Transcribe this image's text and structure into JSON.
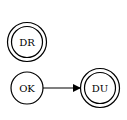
{
  "diagram": {
    "type": "state-machine",
    "nodes": [
      {
        "id": "DR",
        "label": "DR",
        "shape": "doublecircle",
        "cx": 27,
        "cy": 42
      },
      {
        "id": "OK",
        "label": "OK",
        "shape": "circle",
        "cx": 27,
        "cy": 88
      },
      {
        "id": "DU",
        "label": "DU",
        "shape": "doublecircle",
        "cx": 100,
        "cy": 88
      }
    ],
    "edges": [
      {
        "from": "OK",
        "to": "DU",
        "label": ""
      }
    ],
    "colors": {
      "stroke": "#000000",
      "background": "#ffffff"
    }
  }
}
